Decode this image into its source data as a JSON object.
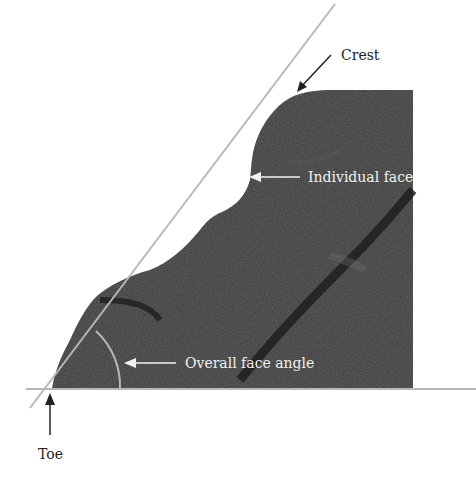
{
  "figure": {
    "labels": {
      "crest": "Crest",
      "individual_face": "Individual face",
      "overall_face_angle": "Overall face angle",
      "toe": "Toe"
    },
    "colors": {
      "rock": "#3a3a3a",
      "rock_dark": "#262626",
      "guide_line": "#b8b8b8",
      "label_dark": "#222222",
      "label_light": "#f2f2f2",
      "background": "#ffffff"
    }
  }
}
